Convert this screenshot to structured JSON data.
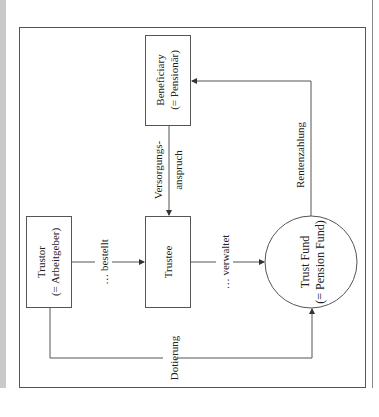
{
  "diagram": {
    "orientation": "rotated 90° counter-clockwise",
    "nodes": {
      "trustor": {
        "line1": "Trustor",
        "line2": "(= Arbeitgeber)"
      },
      "trustee": {
        "line1": "Trustee"
      },
      "beneficiary": {
        "line1": "Beneficiary",
        "line2": "(= Pensionär)"
      },
      "trust_fund": {
        "line1": "Trust Fund",
        "line2": "(= Pension Fund)"
      }
    },
    "edges": {
      "bestellt": {
        "label": "… bestellt",
        "from": "Trustor",
        "to": "Trustee"
      },
      "verwaltet": {
        "label": "… verwaltet",
        "from": "Trustee",
        "to": "Trust Fund"
      },
      "versorgungsanspruch": {
        "line1": "Versorgungs-",
        "line2": "anspruch",
        "from": "Beneficiary",
        "to": "Trustee"
      },
      "rentenzahlung": {
        "label": "Rentenzahlung",
        "from": "Trust Fund",
        "to": "Beneficiary"
      },
      "dotierung": {
        "label": "Dotierung",
        "from": "Trustor",
        "to": "Trust Fund"
      }
    },
    "colors": {
      "line": "#555555",
      "text": "#222222",
      "page_strip": "#c9c9c9"
    }
  }
}
